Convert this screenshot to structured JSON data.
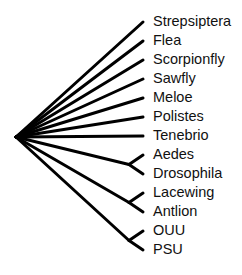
{
  "diagram": {
    "type": "phylogenetic-tree",
    "style": "cladogram",
    "line_color": "#000000",
    "text_color": "#111111",
    "root": {
      "children": [
        {
          "taxon": "Strepsiptera"
        },
        {
          "taxon": "Flea"
        },
        {
          "taxon": "Scorpionfly"
        },
        {
          "taxon": "Sawfly"
        },
        {
          "taxon": "Meloe"
        },
        {
          "taxon": "Polistes"
        },
        {
          "taxon": "Tenebrio"
        },
        {
          "clade": [
            {
              "taxon": "Aedes"
            },
            {
              "taxon": "Drosophila"
            }
          ]
        },
        {
          "clade": [
            {
              "taxon": "Lacewing"
            },
            {
              "taxon": "Antlion"
            }
          ]
        },
        {
          "clade": [
            {
              "taxon": "OUU"
            },
            {
              "taxon": "PSU"
            }
          ]
        }
      ]
    },
    "taxa": [
      "Strepsiptera",
      "Flea",
      "Scorpionfly",
      "Sawfly",
      "Meloe",
      "Polistes",
      "Tenebrio",
      "Aedes",
      "Drosophila",
      "Lacewing",
      "Antlion",
      "OUU",
      "PSU"
    ]
  }
}
